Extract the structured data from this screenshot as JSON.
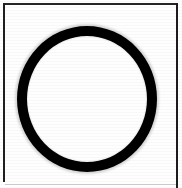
{
  "figure": {
    "caption": "",
    "description": "Thick black circular ring centered inside a thin rectangular border frame",
    "background_color": "#ffffff",
    "stroke_color": "#000000",
    "frame_color": "#1f1f1f",
    "bottom_edge_color": "#cfcfcf",
    "canvas": {
      "width": 182,
      "height": 188
    },
    "frame": {
      "name": "rectangular-border",
      "left": 3,
      "top": 3,
      "right": 178,
      "bottom": 185,
      "stroke_width": 2
    },
    "shapes": [
      {
        "name": "ring",
        "type": "circle-outline",
        "center_x": 87,
        "center_y": 99,
        "outer_width": 140,
        "outer_height": 146,
        "stroke_width": 10,
        "color": "#000000",
        "fill": "none"
      }
    ],
    "labels": []
  }
}
